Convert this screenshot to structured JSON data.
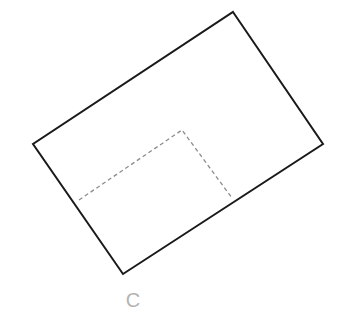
{
  "figure": {
    "type": "geometry-diagram",
    "canvas": {
      "width": 345,
      "height": 321,
      "background": "#ffffff"
    },
    "outer_shape": {
      "name": "rotated-rectangle",
      "stroke_color": "#1a1a1a",
      "stroke_width": 2,
      "fill": "none",
      "line_style": "solid",
      "points": "233,12 323,144 123,274 33,144",
      "vertices": [
        {
          "id": "top",
          "x": 233,
          "y": 12
        },
        {
          "id": "right",
          "x": 323,
          "y": 144
        },
        {
          "id": "bottom",
          "x": 123,
          "y": 274
        },
        {
          "id": "left",
          "x": 33,
          "y": 144
        }
      ]
    },
    "inner_shape": {
      "name": "dashed-inner-rectangle",
      "stroke_color": "#8c8c8c",
      "stroke_width": 1.3,
      "fill": "none",
      "line_style": "dashed",
      "dash_pattern": "4 3",
      "points": "79,200 182,130 232,198",
      "vertices": [
        {
          "id": "dash-left",
          "x": 79,
          "y": 200
        },
        {
          "id": "dash-corner",
          "x": 182,
          "y": 130
        },
        {
          "id": "dash-right",
          "x": 232,
          "y": 198
        }
      ]
    },
    "label": {
      "text": "C",
      "x": 133,
      "y": 307,
      "color": "#b3b3b3",
      "font_size": 20
    }
  }
}
